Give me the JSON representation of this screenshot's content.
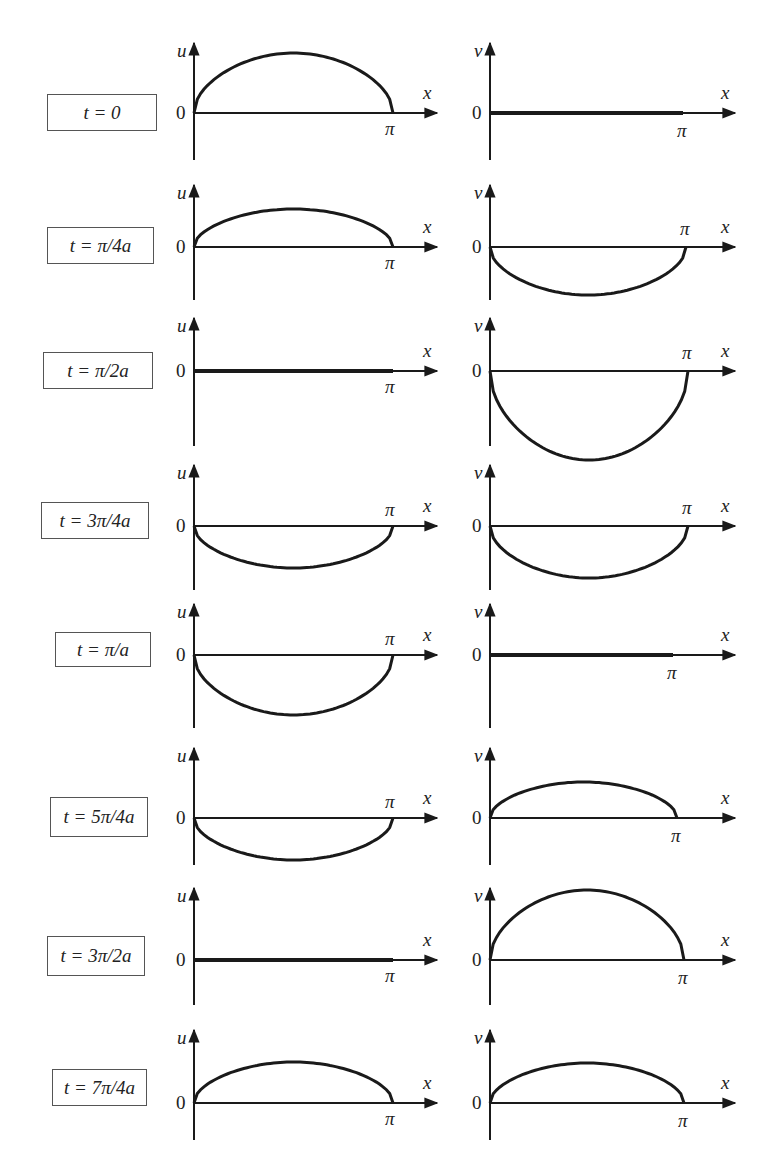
{
  "figure": {
    "axis_labels": {
      "u": "u",
      "v": "v",
      "x": "x",
      "origin": "0",
      "pi": "π"
    },
    "colors": {
      "line": "#1a1a1a",
      "axis": "#1a1a1a",
      "box_border": "#555555",
      "background": "#ffffff"
    }
  },
  "rows": [
    {
      "time_label": "t = 0",
      "u_amp": 60,
      "v_amp": 0,
      "y0": 113,
      "top": 43,
      "bottom": 160,
      "box": [
        47,
        94,
        110,
        37
      ],
      "u_pi_above": false,
      "v_pi_above": false,
      "v_end": 683
    },
    {
      "time_label": "t = π/4a",
      "u_amp": 38,
      "v_amp": -48,
      "y0": 247,
      "top": 185,
      "bottom": 300,
      "box": [
        47,
        227,
        107,
        37
      ],
      "u_pi_above": false,
      "v_pi_above": true,
      "v_end": 686
    },
    {
      "time_label": "t = π/2a",
      "u_amp": 0,
      "v_amp": -89,
      "y0": 371,
      "top": 318,
      "bottom": 446,
      "box": [
        43,
        352,
        110,
        37
      ],
      "u_pi_above": false,
      "v_pi_above": true,
      "v_end": 688
    },
    {
      "time_label": "t = 3π/4a",
      "u_amp": -42,
      "v_amp": -52,
      "y0": 526,
      "top": 465,
      "bottom": 590,
      "box": [
        41,
        502,
        108,
        37
      ],
      "u_pi_above": true,
      "v_pi_above": true,
      "v_end": 688
    },
    {
      "time_label": "t = π/a",
      "u_amp": -60,
      "v_amp": 0,
      "y0": 655,
      "top": 604,
      "bottom": 728,
      "box": [
        55,
        632,
        96,
        35
      ],
      "u_pi_above": true,
      "v_pi_above": false,
      "v_end": 673
    },
    {
      "time_label": "t = 5π/4a",
      "u_amp": -42,
      "v_amp": 36,
      "y0": 818,
      "top": 748,
      "bottom": 865,
      "box": [
        50,
        797,
        98,
        40
      ],
      "u_pi_above": true,
      "v_pi_above": false,
      "v_end": 677
    },
    {
      "time_label": "t = 3π/2a",
      "u_amp": 0,
      "v_amp": 70,
      "y0": 960,
      "top": 888,
      "bottom": 1005,
      "box": [
        47,
        936,
        98,
        40
      ],
      "u_pi_above": false,
      "v_pi_above": false,
      "v_end": 684
    },
    {
      "time_label": "t = 7π/4a",
      "u_amp": 41,
      "v_amp": 40,
      "y0": 1103,
      "top": 1030,
      "bottom": 1140,
      "box": [
        52,
        1069,
        95,
        37
      ],
      "u_pi_above": false,
      "v_pi_above": false,
      "v_end": 684
    }
  ],
  "layout": {
    "u_axis_x": 194,
    "u_pi_x": 393,
    "u_arrow_end": 437,
    "v_axis_x": 490,
    "v_arrow_end": 735
  },
  "chart_data": {
    "type": "line",
    "title": "",
    "xlabel": "x",
    "x_ticks": [
      "0",
      "π"
    ],
    "panels": [
      {
        "time": "t = 0",
        "u_relative_amplitude": 1.0,
        "v_relative_amplitude": 0.0
      },
      {
        "time": "t = π/4a",
        "u_relative_amplitude": 0.63,
        "v_relative_amplitude": -0.8
      },
      {
        "time": "t = π/2a",
        "u_relative_amplitude": 0.0,
        "v_relative_amplitude": -1.48
      },
      {
        "time": "t = 3π/4a",
        "u_relative_amplitude": -0.7,
        "v_relative_amplitude": -0.87
      },
      {
        "time": "t = π/a",
        "u_relative_amplitude": -1.0,
        "v_relative_amplitude": 0.0
      },
      {
        "time": "t = 5π/4a",
        "u_relative_amplitude": -0.7,
        "v_relative_amplitude": 0.6
      },
      {
        "time": "t = 3π/2a",
        "u_relative_amplitude": 0.0,
        "v_relative_amplitude": 1.17
      },
      {
        "time": "t = 7π/4a",
        "u_relative_amplitude": 0.68,
        "v_relative_amplitude": 0.67
      }
    ],
    "ylabels": [
      "u",
      "v"
    ],
    "grid": false,
    "legend": "none"
  }
}
